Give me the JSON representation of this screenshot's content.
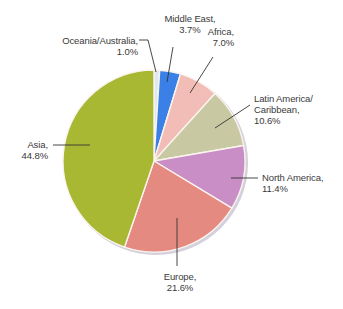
{
  "chart_data": {
    "type": "pie",
    "title": "",
    "start_angle_deg": -90,
    "direction": "clockwise",
    "slices": [
      {
        "id": "oceania",
        "label_lines": [
          "Oceania/Australia,",
          "1.0%"
        ],
        "name": "Oceania/Australia",
        "value": 1.0,
        "color": "#dbe9f3"
      },
      {
        "id": "middle-east",
        "label_lines": [
          "Middle East,",
          "3.7%"
        ],
        "name": "Middle East",
        "value": 3.7,
        "color": "#3a80e6"
      },
      {
        "id": "africa",
        "label_lines": [
          "Africa,",
          "7.0%"
        ],
        "name": "Africa",
        "value": 7.0,
        "color": "#f3bdb7"
      },
      {
        "id": "latin-america",
        "label_lines": [
          "Latin America/",
          "Caribbean,",
          "10.6%"
        ],
        "name": "Latin America/Caribbean",
        "value": 10.6,
        "color": "#c8c9a2"
      },
      {
        "id": "north-america",
        "label_lines": [
          "North America,",
          "11.4%"
        ],
        "name": "North America",
        "value": 11.4,
        "color": "#c98ec5"
      },
      {
        "id": "europe",
        "label_lines": [
          "Europe,",
          "21.6%"
        ],
        "name": "Europe",
        "value": 21.6,
        "color": "#e58a81"
      },
      {
        "id": "asia",
        "label_lines": [
          "Asia,",
          "44.8%"
        ],
        "name": "Asia",
        "value": 44.8,
        "color": "#a9b833"
      }
    ],
    "legend": "none",
    "units": "%"
  },
  "layout": {
    "center": [
      154,
      161
    ],
    "radius": 91,
    "slice_stroke": "#fbf4ee",
    "leader_color": "#333333",
    "shadow_color": "#d4d0dc"
  },
  "labels": {
    "oceania": {
      "x": 48,
      "y": 35,
      "align": "r",
      "w": 90
    },
    "middle-east": {
      "x": 155,
      "y": 13,
      "align": "c",
      "w": 70
    },
    "africa": {
      "x": 200,
      "y": 26,
      "align": "r",
      "w": 34
    },
    "latin-america": {
      "x": 254,
      "y": 93,
      "align": "l",
      "w": 80
    },
    "north-america": {
      "x": 262,
      "y": 172,
      "align": "l",
      "w": 80
    },
    "europe": {
      "x": 155,
      "y": 271,
      "align": "c",
      "w": 50
    },
    "asia": {
      "x": 10,
      "y": 139,
      "align": "r",
      "w": 38
    }
  },
  "leaders": [
    {
      "id": "oceania",
      "points": [
        [
          139,
          40
        ],
        [
          148,
          40
        ],
        [
          156,
          72
        ]
      ]
    },
    {
      "id": "middle-east",
      "points": [
        [
          173,
          47
        ],
        [
          167,
          82
        ]
      ]
    },
    {
      "id": "africa",
      "points": [
        [
          213,
          57
        ],
        [
          190,
          93
        ]
      ]
    },
    {
      "id": "latin-america",
      "points": [
        [
          250,
          105
        ],
        [
          215,
          128
        ]
      ]
    },
    {
      "id": "north-america",
      "points": [
        [
          258,
          178
        ],
        [
          231,
          178
        ]
      ]
    },
    {
      "id": "europe",
      "points": [
        [
          177,
          266
        ],
        [
          177,
          218
        ]
      ]
    },
    {
      "id": "asia",
      "points": [
        [
          53,
          145
        ],
        [
          90,
          145
        ]
      ]
    }
  ]
}
